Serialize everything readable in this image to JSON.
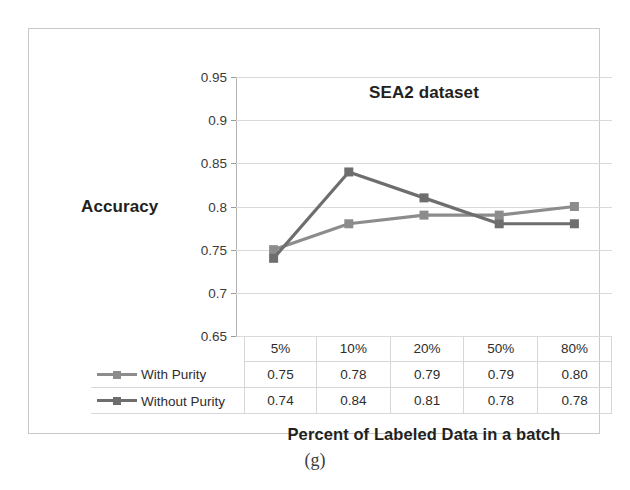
{
  "figure": {
    "caption": "(g)"
  },
  "chart_data": {
    "type": "line",
    "title": "SEA2 dataset",
    "xlabel": "Percent of Labeled Data in a batch",
    "ylabel": "Accuracy",
    "categories": [
      "5%",
      "10%",
      "20%",
      "50%",
      "80%"
    ],
    "series": [
      {
        "name": "With Purity",
        "color": "#8c8c8c",
        "values": [
          0.75,
          0.78,
          0.79,
          0.79,
          0.8
        ],
        "labels": [
          "0.75",
          "0.78",
          "0.79",
          "0.79",
          "0.80"
        ]
      },
      {
        "name": "Without Purity",
        "color": "#6e6e6e",
        "values": [
          0.74,
          0.84,
          0.81,
          0.78,
          0.78
        ],
        "labels": [
          "0.74",
          "0.84",
          "0.81",
          "0.78",
          "0.78"
        ]
      }
    ],
    "ylim": [
      0.65,
      0.95
    ],
    "yticks": [
      0.95,
      0.9,
      0.85,
      0.8,
      0.75,
      0.7,
      0.65
    ],
    "ytick_labels": [
      "0.95",
      "0.9",
      "0.85",
      "0.8",
      "0.75",
      "0.7",
      "0.65"
    ],
    "grid": true,
    "legend_position": "table-left",
    "marker": "square"
  }
}
